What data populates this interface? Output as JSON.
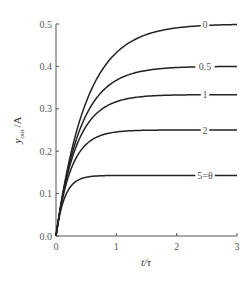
{
  "chart_data": {
    "type": "line",
    "title": "",
    "xlabel": "t/τ",
    "ylabel": "y_out/A",
    "ylabel_main": "y",
    "ylabel_sub": "out",
    "ylabel_suffix": "/A",
    "xlim": [
      0,
      3
    ],
    "ylim": [
      0,
      0.5
    ],
    "grid": false,
    "legend_position": "inline labels at right end of curves",
    "x_ticks": [
      0,
      1,
      2,
      3
    ],
    "x_tick_labels": [
      "0",
      "1",
      "2",
      "3"
    ],
    "y_ticks": [
      0.0,
      0.1,
      0.2,
      0.3,
      0.4,
      0.5
    ],
    "y_tick_labels": [
      "0.0",
      "0.1",
      "0.2",
      "0.3",
      "0.4",
      "0.5"
    ],
    "x": [
      0,
      0.1,
      0.2,
      0.3,
      0.4,
      0.5,
      0.75,
      1.0,
      1.5,
      2.0,
      2.5,
      3.0
    ],
    "series": [
      {
        "name": "0",
        "label": "0",
        "theta": 0,
        "plateau": 0.5,
        "values": [
          0.0,
          0.091,
          0.165,
          0.226,
          0.275,
          0.316,
          0.389,
          0.432,
          0.475,
          0.491,
          0.497,
          0.499
        ]
      },
      {
        "name": "0.5",
        "label": "0.5",
        "theta": 0.5,
        "plateau": 0.4,
        "values": [
          0.0,
          0.089,
          0.158,
          0.211,
          0.253,
          0.285,
          0.339,
          0.367,
          0.391,
          0.397,
          0.399,
          0.4
        ]
      },
      {
        "name": "1",
        "label": "1",
        "theta": 1,
        "plateau": 0.333,
        "values": [
          0.0,
          0.086,
          0.15,
          0.198,
          0.233,
          0.259,
          0.299,
          0.317,
          0.33,
          0.333,
          0.333,
          0.333
        ]
      },
      {
        "name": "2",
        "label": "2",
        "theta": 2,
        "plateau": 0.25,
        "values": [
          0.0,
          0.082,
          0.138,
          0.175,
          0.2,
          0.216,
          0.238,
          0.245,
          0.249,
          0.25,
          0.25,
          0.25
        ]
      },
      {
        "name": "5",
        "label": "5=θ",
        "theta": 5,
        "plateau": 0.143,
        "values": [
          0.0,
          0.072,
          0.108,
          0.125,
          0.134,
          0.138,
          0.142,
          0.143,
          0.143,
          0.143,
          0.143,
          0.143
        ]
      }
    ]
  },
  "colors": {
    "curve": "#222222",
    "axis": "#555555",
    "label": "#555555"
  }
}
